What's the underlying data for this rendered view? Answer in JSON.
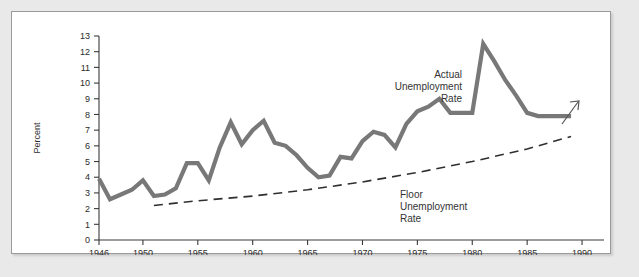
{
  "figure": {
    "background_color": "#ffffff",
    "page_background_color": "#e9e9e9",
    "border_color": "#9a9a9a"
  },
  "axes": {
    "y_title": "Percent",
    "y_ticks": [
      "0",
      "1",
      "2",
      "3",
      "4",
      "5",
      "6",
      "7",
      "8",
      "9",
      "10",
      "11",
      "12",
      "13"
    ],
    "x_ticks": [
      "1946",
      "1950",
      "1955",
      "1960",
      "1965",
      "1970",
      "1975",
      "1980",
      "1985",
      "1990"
    ]
  },
  "annotations": {
    "actual_label": {
      "line1": "Actual",
      "line2": "Unemployment",
      "line3": "Rate"
    },
    "floor_label": {
      "line1": "Floor",
      "line2": "Unemployment",
      "line3": "Rate"
    },
    "trend_arrow": "arrow-up-right-icon"
  },
  "chart_data": {
    "type": "line",
    "title": "",
    "xlabel": "",
    "ylabel": "Percent",
    "xlim": [
      1946,
      1992
    ],
    "ylim": [
      0,
      13
    ],
    "grid": false,
    "legend_position": "inline-annotations",
    "colors": {
      "actual": "#787878",
      "floor": "#2f2f2f"
    },
    "series": [
      {
        "name": "Actual Unemployment Rate",
        "style": "solid-thick",
        "color": "#787878",
        "x": [
          1946,
          1947,
          1948,
          1949,
          1950,
          1951,
          1952,
          1953,
          1954,
          1955,
          1956,
          1957,
          1958,
          1959,
          1960,
          1961,
          1962,
          1963,
          1964,
          1965,
          1966,
          1967,
          1968,
          1969,
          1970,
          1971,
          1972,
          1973,
          1974,
          1975,
          1976,
          1977,
          1978,
          1979,
          1980,
          1981,
          1982,
          1983,
          1984,
          1985,
          1986,
          1987,
          1988,
          1989
        ],
        "values": [
          3.9,
          2.6,
          2.9,
          3.2,
          3.8,
          2.8,
          2.9,
          3.3,
          4.9,
          4.9,
          3.8,
          5.9,
          7.5,
          6.1,
          7.0,
          7.6,
          6.2,
          6.0,
          5.4,
          4.6,
          4.0,
          4.1,
          5.3,
          5.2,
          6.3,
          6.9,
          6.7,
          5.9,
          7.4,
          8.2,
          8.5,
          9.0,
          8.1,
          8.1,
          8.1,
          12.5,
          11.4,
          10.2,
          9.2,
          8.1,
          7.9,
          7.9,
          7.9,
          7.9
        ]
      },
      {
        "name": "Floor Unemployment Rate",
        "style": "dashed",
        "color": "#2f2f2f",
        "x": [
          1951,
          1955,
          1960,
          1965,
          1970,
          1975,
          1980,
          1985,
          1989
        ],
        "values": [
          2.2,
          2.5,
          2.8,
          3.2,
          3.7,
          4.3,
          5.0,
          5.8,
          6.6
        ]
      }
    ]
  }
}
